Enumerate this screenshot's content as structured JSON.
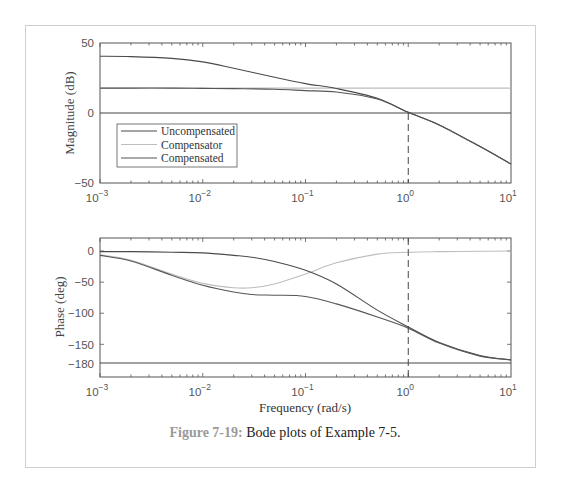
{
  "figure": {
    "caption_label": "Figure 7-19:",
    "caption_text": " Bode plots of Example 7-5."
  },
  "colors": {
    "uncompensated": "#4a4a4a",
    "compensator": "#bdbdbd",
    "compensated": "#555555",
    "axes": "#555555",
    "frame_border": "#cfcfcf",
    "caption_label": "#9a9a9a"
  },
  "chart_data": [
    {
      "type": "line",
      "title": "",
      "xlabel": "",
      "ylabel": "Magnitude (dB)",
      "xscale": "log",
      "xlim": [
        0.001,
        10
      ],
      "ylim": [
        -50,
        50
      ],
      "xtick_labels": [
        "10^-3",
        "10^-2",
        "10^-1",
        "10^0",
        "10^1"
      ],
      "ytick_labels": [
        "50",
        "0",
        "-50"
      ],
      "grid": false,
      "legend": {
        "position": "inside lower-left",
        "entries": [
          "Uncompensated",
          "Compensator",
          "Compensated"
        ]
      },
      "reference_lines": [
        {
          "type": "horizontal",
          "y": 0,
          "style": "solid"
        },
        {
          "type": "vertical",
          "x": 1.0,
          "style": "dashed",
          "from_y": 0,
          "to_y": -50
        }
      ],
      "x": [
        0.001,
        0.002,
        0.005,
        0.01,
        0.02,
        0.05,
        0.1,
        0.2,
        0.5,
        1,
        2,
        5,
        10
      ],
      "series": [
        {
          "name": "Uncompensated",
          "values": [
            40.5,
            40.3,
            39.0,
            36.5,
            32.0,
            25.5,
            21.0,
            17.5,
            10.5,
            0.5,
            -8.5,
            -24.0,
            -36.5
          ]
        },
        {
          "name": "Compensator",
          "values": [
            17.8,
            17.8,
            17.8,
            17.8,
            17.8,
            17.8,
            17.8,
            17.8,
            17.8,
            17.8,
            17.8,
            17.8,
            17.8
          ]
        },
        {
          "name": "Compensated",
          "values": [
            17.8,
            17.8,
            17.8,
            17.6,
            17.4,
            17.0,
            16.0,
            15.0,
            10.0,
            0.5,
            -8.5,
            -24.0,
            -36.5
          ]
        }
      ]
    },
    {
      "type": "line",
      "title": "",
      "xlabel": "Frequency (rad/s)",
      "ylabel": "Phase (deg)",
      "xscale": "log",
      "xlim": [
        0.001,
        10
      ],
      "ylim": [
        -200,
        20
      ],
      "xtick_labels": [
        "10^-3",
        "10^-2",
        "10^-1",
        "10^0",
        "10^1"
      ],
      "ytick_labels": [
        "0",
        "-50",
        "-100",
        "-150",
        "-180"
      ],
      "grid": false,
      "reference_lines": [
        {
          "type": "horizontal",
          "y": -180,
          "style": "solid"
        },
        {
          "type": "vertical",
          "x": 1.0,
          "style": "dashed",
          "from_y": 20,
          "to_y": -200
        }
      ],
      "x": [
        0.001,
        0.002,
        0.005,
        0.01,
        0.02,
        0.03,
        0.05,
        0.1,
        0.2,
        0.5,
        1,
        2,
        5,
        10
      ],
      "series": [
        {
          "name": "Uncompensated",
          "values": [
            -1,
            -1,
            -2,
            -3,
            -7,
            -10,
            -17,
            -31,
            -53,
            -95,
            -122,
            -147,
            -168,
            -175
          ]
        },
        {
          "name": "Compensator",
          "values": [
            -6,
            -15,
            -37,
            -52,
            -59,
            -59,
            -53,
            -37,
            -19,
            -5,
            -2,
            -1,
            -0.5,
            0
          ]
        },
        {
          "name": "Compensated",
          "values": [
            -7,
            -16,
            -39,
            -55,
            -66,
            -70,
            -71,
            -73,
            -85,
            -106,
            -124,
            -148,
            -169,
            -175
          ]
        }
      ]
    }
  ],
  "labels": {
    "mag_ylabel": "Magnitude (dB)",
    "phase_ylabel": "Phase (deg)",
    "xlabel": "Frequency (rad/s)",
    "mag_yticks": [
      "50",
      "0",
      "−50"
    ],
    "phase_yticks": [
      "0",
      "−50",
      "−100",
      "−150",
      "−180"
    ],
    "xticks_base": [
      "10",
      "10",
      "10",
      "10",
      "10"
    ],
    "xticks_exp": [
      "−3",
      "−2",
      "−1",
      "0",
      "1"
    ],
    "legend": [
      "Uncompensated",
      "Compensator",
      "Compensated"
    ]
  }
}
